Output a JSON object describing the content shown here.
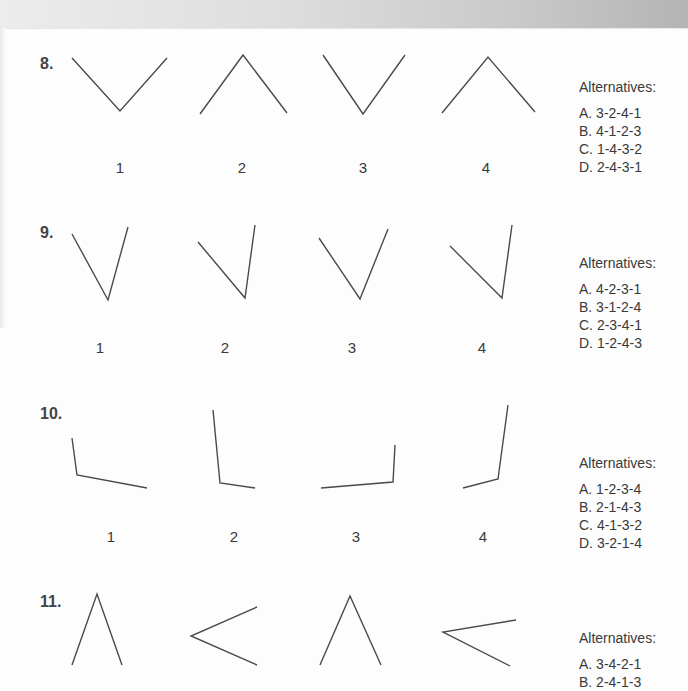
{
  "questions": [
    {
      "number": "8.",
      "alternatives_label": "Alternatives:",
      "figure_labels": [
        "1",
        "2",
        "3",
        "4"
      ],
      "alternatives": [
        "A. 3-2-4-1",
        "B. 4-1-2-3",
        "C. 1-4-3-2",
        "D. 2-4-3-1"
      ]
    },
    {
      "number": "9.",
      "alternatives_label": "Alternatives:",
      "figure_labels": [
        "1",
        "2",
        "3",
        "4"
      ],
      "alternatives": [
        "A. 4-2-3-1",
        "B. 3-1-2-4",
        "C. 2-3-4-1",
        "D. 1-2-4-3"
      ]
    },
    {
      "number": "10.",
      "alternatives_label": "Alternatives:",
      "figure_labels": [
        "1",
        "2",
        "3",
        "4"
      ],
      "alternatives": [
        "A. 1-2-3-4",
        "B. 2-1-4-3",
        "C. 4-1-3-2",
        "D. 3-2-1-4"
      ]
    },
    {
      "number": "11.",
      "alternatives_label": "Alternatives:",
      "alternatives": [
        "A. 3-4-2-1",
        "B. 2-4-1-3"
      ]
    }
  ]
}
